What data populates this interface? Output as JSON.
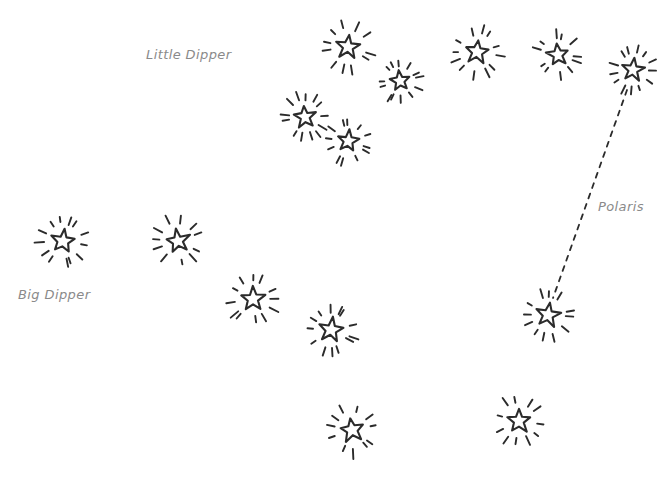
{
  "scene": {
    "title": "Star Constellation Sketch",
    "width": 670,
    "height": 479,
    "background_color": "#ffffff",
    "ink_color": "#2b2b2b",
    "label_color": "#8a8a8a",
    "style": "hand-drawn doodle"
  },
  "top_edge_artifact": {
    "text": "",
    "note": "faint cropped text fragment at very top edge"
  },
  "labels": [
    {
      "id": "little-dipper",
      "text": "Little Dipper",
      "x": 146,
      "y": 47
    },
    {
      "id": "big-dipper",
      "text": "Big Dipper",
      "x": 18,
      "y": 287
    },
    {
      "id": "polaris",
      "text": "Polaris",
      "x": 598,
      "y": 199
    }
  ],
  "connector": {
    "name": "polaris-pointer-line",
    "style": "dashed",
    "color": "#2b2b2b",
    "x1": 627,
    "y1": 90,
    "x2": 553,
    "y2": 298
  },
  "chart_data": {
    "type": "scatter",
    "xlabel": "",
    "ylabel": "",
    "xlim": [
      0,
      670
    ],
    "ylim": [
      0,
      479
    ],
    "grid": false,
    "legend": "none",
    "annotations": [
      "Little Dipper",
      "Big Dipper",
      "Polaris"
    ],
    "series": [
      {
        "name": "Little Dipper",
        "values": [
          {
            "x": 348,
            "y": 47,
            "r": 13
          },
          {
            "x": 400,
            "y": 81,
            "r": 11
          },
          {
            "x": 477,
            "y": 52,
            "r": 13
          },
          {
            "x": 558,
            "y": 55,
            "r": 12
          },
          {
            "x": 633,
            "y": 70,
            "r": 12
          },
          {
            "x": 305,
            "y": 117,
            "r": 12
          },
          {
            "x": 348,
            "y": 141,
            "r": 12
          }
        ]
      },
      {
        "name": "Big Dipper",
        "values": [
          {
            "x": 63,
            "y": 241,
            "r": 13
          },
          {
            "x": 178,
            "y": 241,
            "r": 13
          },
          {
            "x": 253,
            "y": 299,
            "r": 13
          },
          {
            "x": 331,
            "y": 330,
            "r": 13
          },
          {
            "x": 352,
            "y": 430,
            "r": 13
          },
          {
            "x": 519,
            "y": 421,
            "r": 13
          },
          {
            "x": 548,
            "y": 315,
            "r": 13
          }
        ]
      }
    ]
  }
}
